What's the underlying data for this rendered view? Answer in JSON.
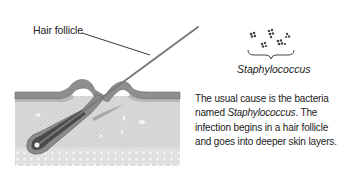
{
  "figure": {
    "labels": {
      "hair_follicle": "Hair follicle",
      "bacteria": "Staphylococcus"
    },
    "caption": {
      "line1": "The usual cause is the bacteria",
      "line2_prefix": "named ",
      "line2_italic": "Staphylococcus",
      "line2_suffix": ". The",
      "line3": "infection begins in a hair follicle",
      "line4": "and goes into deeper skin layers."
    },
    "colors": {
      "skin_surface": "#8c8c8c",
      "dermis": "#dcdcdc",
      "follicle": "#6e6e6e",
      "hair": "#7a7a7a",
      "text": "#222222"
    }
  }
}
